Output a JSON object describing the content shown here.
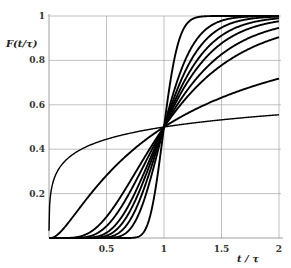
{
  "chart_data": {
    "type": "line",
    "title": "",
    "xlabel": "t / τ",
    "ylabel": "F(t/τ)",
    "xlim": [
      0,
      2
    ],
    "ylim": [
      0,
      1
    ],
    "x_ticks": [
      "0.5",
      "1",
      "1.5",
      "2"
    ],
    "y_ticks": [
      "0.2",
      "0.4",
      "0.6",
      "0.8",
      "1"
    ],
    "grid": true,
    "legend": null,
    "series": [
      {
        "name": "curve-1",
        "sigma": 0.1
      },
      {
        "name": "curve-2",
        "sigma": 0.2
      },
      {
        "name": "curve-3",
        "sigma": 0.25
      },
      {
        "name": "curve-4",
        "sigma": 0.3
      },
      {
        "name": "curve-5",
        "sigma": 0.35
      },
      {
        "name": "curve-6",
        "sigma": 0.43
      },
      {
        "name": "curve-7",
        "sigma": 0.53
      },
      {
        "name": "curve-8",
        "sigma": 1.2
      },
      {
        "name": "curve-9",
        "sigma": 5.0
      }
    ],
    "values_at_t_1_5": [
      0.995,
      0.98,
      0.96,
      0.925,
      0.88,
      0.83,
      0.78,
      0.63,
      0.53
    ],
    "values_at_t_2": [
      1.0,
      1.0,
      0.99,
      0.99,
      0.98,
      0.94,
      0.87,
      0.69,
      0.56
    ]
  },
  "axes": {
    "ylabel": "F(t/τ)",
    "xlabel": "t / τ",
    "x_ticks": [
      {
        "v": 0.5,
        "label": "0.5"
      },
      {
        "v": 1,
        "label": "1"
      },
      {
        "v": 1.5,
        "label": "1.5"
      },
      {
        "v": 2,
        "label": "2"
      }
    ],
    "y_ticks": [
      {
        "v": 0.2,
        "label": "0.2"
      },
      {
        "v": 0.4,
        "label": "0.4"
      },
      {
        "v": 0.6,
        "label": "0.6"
      },
      {
        "v": 0.8,
        "label": "0.8"
      },
      {
        "v": 1,
        "label": "1"
      }
    ]
  }
}
